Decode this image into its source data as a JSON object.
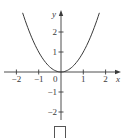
{
  "chart_data": {
    "type": "line",
    "title": "",
    "function": "y = x^2",
    "xlabel": "x",
    "ylabel": "y",
    "xlim": [
      -2.5,
      2.7
    ],
    "ylim": [
      -2.6,
      3.0
    ],
    "grid": false,
    "legend": null,
    "x_ticks": [
      -2,
      -1,
      0,
      1,
      2
    ],
    "x_tick_labels": [
      "−2",
      "−1",
      "0",
      "1",
      "2"
    ],
    "y_ticks": [
      -2,
      -1,
      1,
      2
    ],
    "y_tick_labels": [
      "−2",
      "−1",
      "1",
      "2"
    ],
    "series": [
      {
        "name": "y = x^2",
        "x": [
          -1.72,
          -1.5,
          -1.25,
          -1.0,
          -0.75,
          -0.5,
          -0.25,
          0,
          0.25,
          0.5,
          0.75,
          1.0,
          1.25,
          1.5,
          1.72
        ],
        "y": [
          2.96,
          2.25,
          1.5625,
          1.0,
          0.5625,
          0.25,
          0.0625,
          0,
          0.0625,
          0.25,
          0.5625,
          1.0,
          1.5625,
          2.25,
          2.96
        ]
      }
    ],
    "colors": {
      "curve": "#3a3a3a",
      "axes": "#3a3a3a"
    }
  },
  "answer_box": {
    "label": ""
  }
}
